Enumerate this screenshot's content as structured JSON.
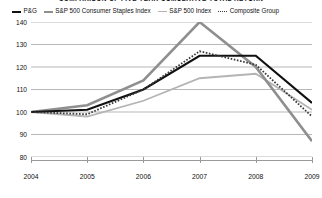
{
  "title": "COMPARISON OF FIVE YEAR CUMULATIVE TOTAL RETURN",
  "legend": {
    "items": [
      {
        "label": "P&G",
        "icon": "line-swatch-solid-black",
        "color": "#111111"
      },
      {
        "label": "S&P 500 Consumer Staples Index",
        "icon": "line-swatch-solid-gray",
        "color": "#8f8f8f"
      },
      {
        "label": "S&P 500 Index",
        "icon": "line-swatch-solid-lightgray",
        "color": "#b4b4b4"
      },
      {
        "label": "Composite Group",
        "icon": "line-swatch-dotted",
        "color": "#3a3a3a"
      }
    ]
  },
  "axes": {
    "y_ticks": [
      "140",
      "130",
      "120",
      "110",
      "100",
      "90",
      "80"
    ],
    "x_ticks": [
      "2004",
      "2005",
      "2006",
      "2007",
      "2008",
      "2009"
    ]
  },
  "chart_data": {
    "type": "line",
    "title": "COMPARISON OF FIVE YEAR CUMULATIVE TOTAL RETURN",
    "xlabel": "",
    "ylabel": "",
    "x": [
      "2004",
      "2005",
      "2006",
      "2007",
      "2008",
      "2009"
    ],
    "categories": [
      "2004",
      "2005",
      "2006",
      "2007",
      "2008",
      "2009"
    ],
    "ylim": [
      80,
      140
    ],
    "yticks": [
      80,
      90,
      100,
      110,
      120,
      130,
      140
    ],
    "grid": "horizontal",
    "legend_position": "top",
    "series": [
      {
        "name": "P&G",
        "color": "#111111",
        "style": "solid",
        "width": 2.2,
        "values": [
          100,
          101,
          110,
          125,
          125,
          104
        ]
      },
      {
        "name": "S&P 500 Consumer Staples Index",
        "color": "#8f8f8f",
        "style": "solid",
        "width": 2.6,
        "values": [
          100,
          103,
          114,
          140,
          120,
          87
        ]
      },
      {
        "name": "S&P 500 Index",
        "color": "#b4b4b4",
        "style": "solid",
        "width": 1.8,
        "values": [
          100,
          98,
          105,
          115,
          117,
          101
        ]
      },
      {
        "name": "Composite Group",
        "color": "#3a3a3a",
        "style": "dotted",
        "width": 1.8,
        "values": [
          100,
          99,
          110,
          127,
          121,
          98
        ]
      }
    ]
  }
}
